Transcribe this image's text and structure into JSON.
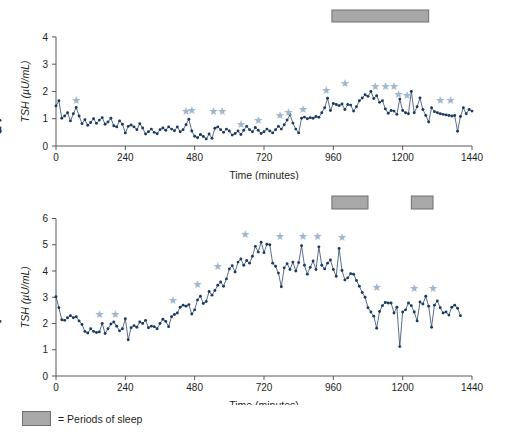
{
  "figure": {
    "legend": {
      "swatch_name": "sleep-period-swatch",
      "text": "= Periods of sleep",
      "swatch_color": "#a8a8a8"
    },
    "colors": {
      "series": "#1b3a5c",
      "line": "#2e4a6b",
      "star": "#9fb6cb",
      "sleep_bar": "#a8a8a8",
      "axis": "#58595b"
    }
  },
  "chart_data": [
    {
      "type": "line",
      "id": "tsh-subject-1",
      "title": "",
      "xlabel": "Time (minutes)",
      "ylabel": "TSH (µU/mL)",
      "xlim": [
        0,
        1440
      ],
      "ylim": [
        0,
        4.4
      ],
      "xticks": [
        0,
        240,
        480,
        720,
        960,
        1200,
        1440
      ],
      "yticks": [
        0,
        1,
        2,
        3,
        4
      ],
      "grid": false,
      "legend_position": "below-figure",
      "x": [
        0,
        10,
        20,
        30,
        40,
        50,
        60,
        70,
        80,
        90,
        100,
        110,
        120,
        130,
        140,
        150,
        160,
        170,
        180,
        190,
        200,
        210,
        220,
        230,
        240,
        250,
        260,
        270,
        280,
        290,
        300,
        310,
        320,
        330,
        340,
        350,
        360,
        370,
        380,
        390,
        400,
        410,
        420,
        430,
        440,
        450,
        460,
        470,
        480,
        490,
        500,
        510,
        520,
        530,
        540,
        550,
        560,
        570,
        580,
        590,
        600,
        610,
        620,
        630,
        640,
        650,
        660,
        670,
        680,
        690,
        700,
        710,
        720,
        730,
        740,
        750,
        760,
        770,
        780,
        790,
        800,
        810,
        820,
        830,
        840,
        850,
        860,
        870,
        880,
        890,
        900,
        910,
        920,
        930,
        940,
        950,
        960,
        970,
        980,
        990,
        1000,
        1010,
        1020,
        1030,
        1040,
        1050,
        1060,
        1070,
        1080,
        1090,
        1100,
        1110,
        1120,
        1130,
        1140,
        1150,
        1160,
        1170,
        1180,
        1190,
        1200,
        1210,
        1220,
        1230,
        1240,
        1250,
        1260,
        1270,
        1280,
        1290,
        1300,
        1310,
        1320,
        1330,
        1340,
        1350,
        1360,
        1370,
        1380,
        1390,
        1400,
        1410,
        1420,
        1430,
        1440
      ],
      "values": [
        1.47,
        1.66,
        1.02,
        1.1,
        1.22,
        0.92,
        1.18,
        1.41,
        1.1,
        0.82,
        0.96,
        0.76,
        0.86,
        1.0,
        0.83,
        0.95,
        1.04,
        0.8,
        0.88,
        1.02,
        0.74,
        0.7,
        0.92,
        0.8,
        0.48,
        0.72,
        0.77,
        0.7,
        0.6,
        0.82,
        0.66,
        0.44,
        0.52,
        0.62,
        0.5,
        0.45,
        0.6,
        0.66,
        0.58,
        0.7,
        0.62,
        0.56,
        0.7,
        0.52,
        0.6,
        0.78,
        0.98,
        0.55,
        0.36,
        0.3,
        0.42,
        0.35,
        0.26,
        0.44,
        0.28,
        0.65,
        0.7,
        0.6,
        0.5,
        0.62,
        0.55,
        0.4,
        0.46,
        0.55,
        0.42,
        0.58,
        0.72,
        0.6,
        0.52,
        0.68,
        0.58,
        0.46,
        0.52,
        0.62,
        0.55,
        0.48,
        0.6,
        0.72,
        0.62,
        0.78,
        0.95,
        1.15,
        0.84,
        0.62,
        0.48,
        1.02,
        1.06,
        1.0,
        1.04,
        1.02,
        1.08,
        1.05,
        1.22,
        1.4,
        1.75,
        1.3,
        1.56,
        1.52,
        1.48,
        1.54,
        1.34,
        1.52,
        1.5,
        1.28,
        1.44,
        1.66,
        1.76,
        1.88,
        1.82,
        2.0,
        1.74,
        1.84,
        1.6,
        1.66,
        1.36,
        1.2,
        1.3,
        1.28,
        1.16,
        1.72,
        1.3,
        1.22,
        1.18,
        2.0,
        1.22,
        1.44,
        1.76,
        1.34,
        1.12,
        0.88,
        1.4,
        1.26,
        1.22,
        1.18,
        1.16,
        1.14,
        1.12,
        1.1,
        1.12,
        0.54,
        1.08,
        1.4,
        1.18,
        1.34,
        1.28,
        0.94,
        0.66,
        0.52,
        0.58,
        0.52
      ],
      "stars": [
        {
          "x": 70,
          "y": 1.68
        },
        {
          "x": 450,
          "y": 1.28
        },
        {
          "x": 470,
          "y": 1.3
        },
        {
          "x": 545,
          "y": 1.28
        },
        {
          "x": 575,
          "y": 1.28
        },
        {
          "x": 640,
          "y": 0.8
        },
        {
          "x": 700,
          "y": 0.92
        },
        {
          "x": 775,
          "y": 1.12
        },
        {
          "x": 805,
          "y": 1.22
        },
        {
          "x": 855,
          "y": 1.35
        },
        {
          "x": 935,
          "y": 2.02
        },
        {
          "x": 1000,
          "y": 2.3
        },
        {
          "x": 1105,
          "y": 2.18
        },
        {
          "x": 1140,
          "y": 2.2
        },
        {
          "x": 1170,
          "y": 2.2
        },
        {
          "x": 1185,
          "y": 1.9
        },
        {
          "x": 1215,
          "y": 1.86
        },
        {
          "x": 1330,
          "y": 1.68
        },
        {
          "x": 1365,
          "y": 1.66
        }
      ],
      "sleep_periods": [
        {
          "start": 955,
          "end": 1290
        }
      ]
    },
    {
      "type": "line",
      "id": "tsh-subject-2",
      "title": "",
      "xlabel": "Time (minutes)",
      "ylabel": "TSH (µU/mL)",
      "xlim": [
        0,
        1440
      ],
      "ylim": [
        0,
        6.4
      ],
      "xticks": [
        0,
        240,
        480,
        720,
        960,
        1200,
        1440
      ],
      "yticks": [
        0,
        1,
        2,
        3,
        4,
        5,
        6
      ],
      "grid": false,
      "legend_position": "below-figure",
      "x": [
        0,
        10,
        20,
        30,
        40,
        50,
        60,
        70,
        80,
        90,
        100,
        110,
        120,
        130,
        140,
        150,
        160,
        170,
        180,
        190,
        200,
        210,
        220,
        230,
        240,
        250,
        260,
        270,
        280,
        290,
        300,
        310,
        320,
        330,
        340,
        350,
        360,
        370,
        380,
        390,
        400,
        410,
        420,
        430,
        440,
        450,
        460,
        470,
        480,
        490,
        500,
        510,
        520,
        530,
        540,
        550,
        560,
        570,
        580,
        590,
        600,
        610,
        620,
        630,
        640,
        650,
        660,
        670,
        680,
        690,
        700,
        710,
        720,
        730,
        740,
        750,
        760,
        770,
        780,
        790,
        800,
        810,
        820,
        830,
        840,
        850,
        860,
        870,
        880,
        890,
        900,
        910,
        920,
        930,
        940,
        950,
        960,
        970,
        980,
        990,
        1000,
        1010,
        1020,
        1030,
        1040,
        1050,
        1060,
        1070,
        1080,
        1090,
        1100,
        1110,
        1120,
        1130,
        1140,
        1150,
        1160,
        1170,
        1180,
        1190,
        1200,
        1210,
        1220,
        1230,
        1240,
        1250,
        1260,
        1270,
        1280,
        1290,
        1300,
        1310,
        1320,
        1330,
        1340,
        1350,
        1360,
        1370,
        1380,
        1390,
        1400
      ],
      "values": [
        3.02,
        2.6,
        2.14,
        2.12,
        2.22,
        2.3,
        2.22,
        2.26,
        2.1,
        1.96,
        1.7,
        1.64,
        1.8,
        1.7,
        1.66,
        1.68,
        2.0,
        1.62,
        1.8,
        1.98,
        2.06,
        1.9,
        1.72,
        1.8,
        2.18,
        1.38,
        1.84,
        1.92,
        1.86,
        2.06,
        2.0,
        2.12,
        1.84,
        1.9,
        1.88,
        1.8,
        2.0,
        2.16,
        2.08,
        1.88,
        2.26,
        2.34,
        2.4,
        2.62,
        2.7,
        2.66,
        2.72,
        2.36,
        2.52,
        2.9,
        3.04,
        2.76,
        2.84,
        3.22,
        3.08,
        3.26,
        3.46,
        3.58,
        3.42,
        3.7,
        4.08,
        4.2,
        3.96,
        4.34,
        4.46,
        4.22,
        4.4,
        4.3,
        4.56,
        4.94,
        4.72,
        5.1,
        4.7,
        5.02,
        5.0,
        4.3,
        4.18,
        3.92,
        3.4,
        4.12,
        4.28,
        4.06,
        4.34,
        4.0,
        4.32,
        4.96,
        4.22,
        3.88,
        4.14,
        4.38,
        4.06,
        4.92,
        4.22,
        4.08,
        4.3,
        4.42,
        4.06,
        3.8,
        4.86,
        4.02,
        3.66,
        3.74,
        3.9,
        3.88,
        3.64,
        3.42,
        3.18,
        3.0,
        2.6,
        2.44,
        2.28,
        1.82,
        2.46,
        2.68,
        2.8,
        2.78,
        2.78,
        2.4,
        2.62,
        1.12,
        2.44,
        2.52,
        2.78,
        2.68,
        2.44,
        2.1,
        2.82,
        2.74,
        3.04,
        2.66,
        1.86,
        2.7,
        2.86,
        2.6,
        2.4,
        2.44,
        2.32,
        2.62,
        2.7,
        2.58,
        2.3,
        2.08
      ],
      "stars": [
        {
          "x": 150,
          "y": 2.36
        },
        {
          "x": 205,
          "y": 2.36
        },
        {
          "x": 405,
          "y": 2.88
        },
        {
          "x": 490,
          "y": 3.48
        },
        {
          "x": 560,
          "y": 4.16
        },
        {
          "x": 655,
          "y": 5.38
        },
        {
          "x": 775,
          "y": 5.3
        },
        {
          "x": 855,
          "y": 5.3
        },
        {
          "x": 905,
          "y": 5.3
        },
        {
          "x": 990,
          "y": 5.28
        },
        {
          "x": 1110,
          "y": 3.38
        },
        {
          "x": 1240,
          "y": 3.34
        },
        {
          "x": 1305,
          "y": 3.34
        }
      ],
      "sleep_periods": [
        {
          "start": 955,
          "end": 1080
        },
        {
          "start": 1230,
          "end": 1305
        }
      ]
    }
  ]
}
